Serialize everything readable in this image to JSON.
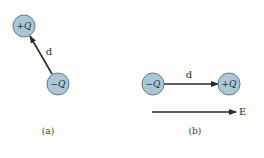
{
  "colors": {
    "charge_fill": "#a9c7d6",
    "charge_stroke": "#5d7c8c",
    "arrow": "#2b2b2b",
    "text": "#2a2a2a"
  },
  "panel_a": {
    "positive_charge": {
      "label": "+Q",
      "cx": 24,
      "cy": 26,
      "r": 11
    },
    "negative_charge": {
      "label": "−Q",
      "cx": 58,
      "cy": 84,
      "r": 11
    },
    "dipole_vector": {
      "label": "d",
      "from": [
        52,
        74
      ],
      "to": [
        30,
        36
      ]
    },
    "caption": "(a)"
  },
  "panel_b": {
    "negative_charge": {
      "label": "−Q",
      "cx": 153,
      "cy": 84,
      "r": 11
    },
    "positive_charge": {
      "label": "+Q",
      "cx": 229,
      "cy": 84,
      "r": 11
    },
    "dipole_vector": {
      "label": "d",
      "from": [
        164,
        84
      ],
      "to": [
        218,
        84
      ]
    },
    "field": {
      "label": "E",
      "from": [
        152,
        112
      ],
      "to": [
        236,
        112
      ]
    },
    "caption": "(b)"
  }
}
